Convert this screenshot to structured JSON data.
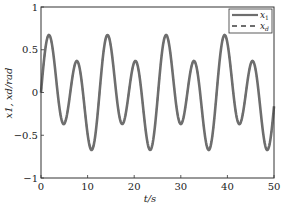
{
  "chart_data": {
    "type": "line",
    "title": "",
    "xlabel": "t/s",
    "ylabel": "x1, xd/rad",
    "xlim": [
      0,
      50
    ],
    "ylim": [
      -1,
      1
    ],
    "xticks": [
      0,
      10,
      20,
      30,
      40,
      50
    ],
    "xtick_labels": [
      "0",
      "10",
      "20",
      "30",
      "40",
      "50"
    ],
    "yticks": [
      1,
      0.5,
      0,
      -0.5,
      -1
    ],
    "ytick_labels": [
      "1",
      "0.5",
      "0",
      "−0.5",
      "−1"
    ],
    "grid": false,
    "legend_position": "upper right",
    "model": {
      "a": 0.215,
      "w1": 0.5,
      "b": 0.515,
      "w2": 1.0,
      "formula": "a*sin(w1*t) + b*sin(w2*t)"
    },
    "series": [
      {
        "name": "x1",
        "style": "solid",
        "color": "#6e6e6e"
      },
      {
        "name": "xd",
        "style": "dashed",
        "color": "#6e6e6e"
      }
    ],
    "key_points": [
      {
        "t": 1.9,
        "y": 0.73
      },
      {
        "t": 4.8,
        "y": -0.28
      },
      {
        "t": 7.7,
        "y": 0.31
      },
      {
        "t": 10.7,
        "y": -0.7
      },
      {
        "t": 14.4,
        "y": 0.72
      },
      {
        "t": 17.4,
        "y": -0.28
      },
      {
        "t": 20.3,
        "y": 0.31
      },
      {
        "t": 23.3,
        "y": -0.7
      },
      {
        "t": 27.0,
        "y": 0.72
      },
      {
        "t": 29.9,
        "y": -0.28
      },
      {
        "t": 32.8,
        "y": 0.31
      },
      {
        "t": 35.9,
        "y": -0.7
      },
      {
        "t": 39.5,
        "y": 0.72
      },
      {
        "t": 42.5,
        "y": -0.28
      },
      {
        "t": 45.4,
        "y": 0.31
      },
      {
        "t": 48.4,
        "y": -0.7
      }
    ]
  },
  "labels": {
    "x_axis": "t/s",
    "y_axis_main": "x",
    "legend_x1": "x",
    "legend_x1_sub": "1",
    "legend_xd": "x",
    "legend_xd_sub": "d"
  }
}
